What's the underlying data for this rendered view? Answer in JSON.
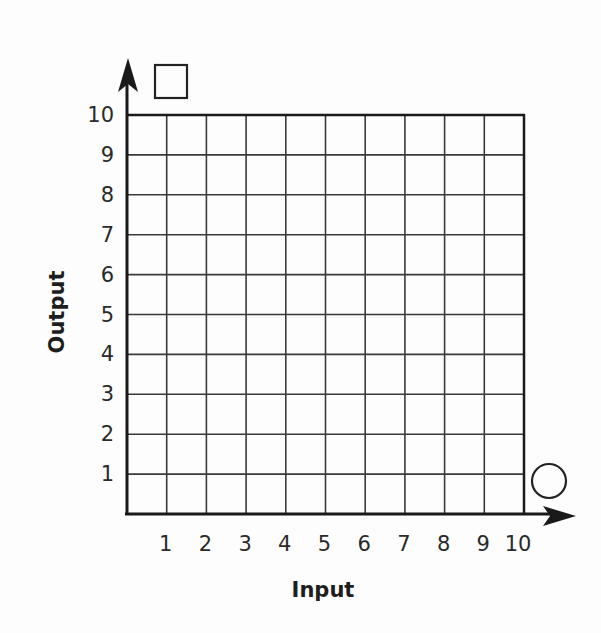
{
  "chart_data": {
    "type": "line",
    "title": "",
    "xlabel": "Input",
    "ylabel": "Output",
    "xlim": [
      0,
      10
    ],
    "ylim": [
      0,
      10
    ],
    "x_ticks": [
      "1",
      "2",
      "3",
      "4",
      "5",
      "6",
      "7",
      "8",
      "9",
      "10"
    ],
    "y_ticks": [
      "1",
      "2",
      "3",
      "4",
      "5",
      "6",
      "7",
      "8",
      "9",
      "10"
    ],
    "grid": true,
    "grid_step": 1,
    "series": [],
    "annotations": [
      {
        "shape": "square",
        "position": "top of y-axis",
        "meaning": "blank box for y-axis rule/label"
      },
      {
        "shape": "circle",
        "position": "end of x-axis",
        "meaning": "blank circle for x-axis rule/label"
      }
    ],
    "colors": {
      "axis": "#1a1a1a",
      "grid": "#3a3a3a",
      "background": "#fdfdfd"
    }
  }
}
